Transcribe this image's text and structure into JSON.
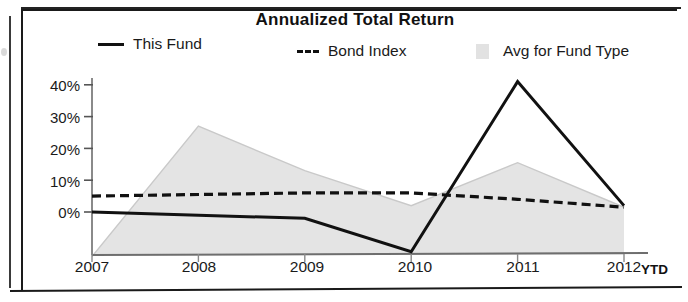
{
  "chart": {
    "title": "Annualized Total Return",
    "x_axis_title": "YTD",
    "legend": [
      {
        "label": "This Fund",
        "marker": "solid-line-swatch"
      },
      {
        "label": "Bond Index",
        "marker": "dashed-line-swatch"
      },
      {
        "label": "Avg for Fund Type",
        "marker": "area-swatch"
      }
    ],
    "y_ticks": [
      "40%",
      "30%",
      "20%",
      "10%",
      "0%"
    ],
    "x_ticks": [
      "2007",
      "2008",
      "2009",
      "2010",
      "2011",
      "2012"
    ]
  },
  "colors": {
    "line_this_fund": "#111111",
    "line_bond_index": "#111111",
    "area_avg_fund_type": "#e4e4e4",
    "area_outline": "#c9c9c9",
    "axis": "#8a8a8a",
    "text": "#1a1a1a",
    "frame": "#1a1a1a",
    "background": "#ffffff"
  },
  "chart_data": {
    "type": "line",
    "title": "Annualized Total Return",
    "xlabel": "YTD",
    "ylabel": "",
    "x": [
      "2007",
      "2008",
      "2009",
      "2010",
      "2011",
      "2012"
    ],
    "categories": [
      "2007",
      "2008",
      "2009",
      "2010",
      "2011",
      "2012"
    ],
    "ylim": [
      -15,
      45
    ],
    "yticks": [
      0,
      10,
      20,
      30,
      40
    ],
    "ytick_labels": [
      "0%",
      "10%",
      "20%",
      "30%",
      "40%"
    ],
    "grid": false,
    "legend_position": "top",
    "series": [
      {
        "name": "This Fund",
        "style": "solid",
        "color": "#111111",
        "values": [
          0,
          -1,
          -2,
          -12.5,
          41,
          2
        ]
      },
      {
        "name": "Bond Index",
        "style": "dashed",
        "color": "#111111",
        "values": [
          5,
          5.5,
          6,
          6,
          4,
          1.5
        ]
      },
      {
        "name": "Avg for Fund Type",
        "style": "filled-area",
        "color": "#e4e4e4",
        "values": [
          -14,
          27,
          13,
          2,
          15.5,
          1.5
        ]
      }
    ]
  }
}
